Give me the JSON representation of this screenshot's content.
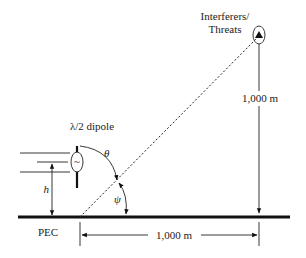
{
  "diagram": {
    "labels": {
      "dipole": "λ/2 dipole",
      "target_line1": "Interferers/",
      "target_line2": "Threats",
      "vertical_distance": "1,000 m",
      "horizontal_distance": "1,000 m",
      "ground": "PEC",
      "height": "h",
      "theta": "θ",
      "psi": "ψ",
      "source_symbol": "~"
    },
    "colors": {
      "line": "#222222",
      "ground": "#111111",
      "background": "#ffffff"
    }
  }
}
